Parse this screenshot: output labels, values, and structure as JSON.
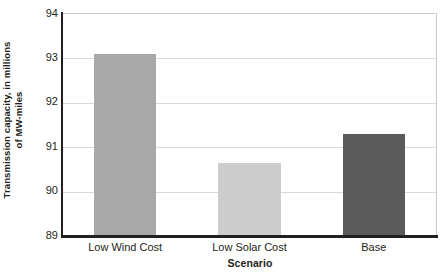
{
  "chart_data": {
    "type": "bar",
    "title": "",
    "subtitle": "",
    "xlabel": "Scenario",
    "ylabel": "Transmission capacity, in millions of MW-miles",
    "ylabel_lines": [
      "Transmission capacity, in millions",
      "of MW-miles"
    ],
    "categories": [
      "Low Wind Cost",
      "Low Solar Cost",
      "Base"
    ],
    "values": [
      93.1,
      90.65,
      91.3
    ],
    "ylim": [
      89,
      94
    ],
    "yticks": [
      94,
      93,
      92,
      91,
      90,
      89
    ],
    "ytick_labels": [
      "94",
      "93",
      "92",
      "91",
      "90",
      "89"
    ],
    "grid": true,
    "grid_axis": "y",
    "legend": false,
    "legend_position": "none",
    "bar_colors": [
      "#a8a8a8",
      "#cdcdcd",
      "#5a5a5a"
    ],
    "axis_color": "#231f20",
    "gridline_color": "#d9d9d9",
    "background_color": "#ffffff"
  },
  "axes": {
    "y_title_line1": "Transmission capacity, in millions",
    "y_title_line2": "of MW-miles",
    "x_title": "Scenario"
  },
  "ticks": {
    "y": [
      "94",
      "93",
      "92",
      "91",
      "90",
      "89"
    ],
    "x": [
      "Low Wind Cost",
      "Low Solar Cost",
      "Base"
    ]
  }
}
